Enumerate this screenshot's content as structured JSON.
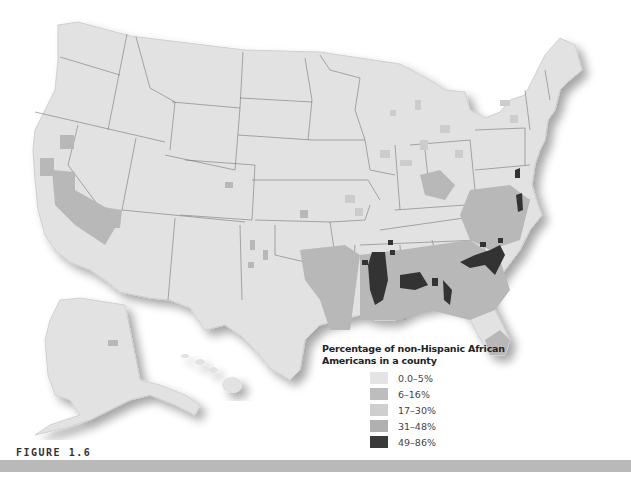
{
  "figure": {
    "label": "FIGURE 1.6"
  },
  "map": {
    "subject": "United States counties",
    "regions_shown": [
      "Contiguous United States",
      "Alaska",
      "Hawaii"
    ],
    "base_color": "#e2e2e2",
    "border_color": "#777777"
  },
  "legend": {
    "title_line1": "Percentage of non-Hispanic African",
    "title_line2": "Americans in a county",
    "items": [
      {
        "label": "0.0–5%",
        "color": "#e4e4e4"
      },
      {
        "label": "6–16%",
        "color": "#bdbdbd"
      },
      {
        "label": "17–30%",
        "color": "#cfcfcf"
      },
      {
        "label": "31–48%",
        "color": "#b0b0b0"
      },
      {
        "label": "49–86%",
        "color": "#3a3a3a"
      }
    ]
  }
}
